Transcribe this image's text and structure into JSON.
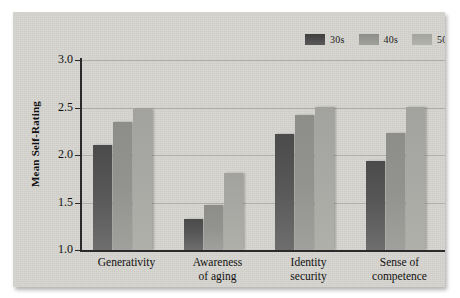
{
  "chart_data": {
    "type": "bar",
    "title": "",
    "xlabel": "",
    "ylabel": "Mean Self-Rating",
    "ylim": [
      1.0,
      3.0
    ],
    "ytick_labels": [
      "1.0",
      "1.5",
      "2.0",
      "2.5",
      "3.0"
    ],
    "ytick_values": [
      1.0,
      1.5,
      2.0,
      2.5,
      3.0
    ],
    "grid": true,
    "legend_position": "top-right",
    "categories": [
      {
        "lines": [
          "Generativity"
        ]
      },
      {
        "lines": [
          "Awareness",
          "of aging"
        ]
      },
      {
        "lines": [
          "Identity",
          "security"
        ]
      },
      {
        "lines": [
          "Sense of",
          "competence"
        ]
      }
    ],
    "series": [
      {
        "name": "30s",
        "color": "#4f4f4f",
        "values": [
          2.11,
          1.33,
          2.22,
          1.94
        ]
      },
      {
        "name": "40s",
        "color": "#919191",
        "values": [
          2.35,
          1.47,
          2.42,
          2.23
        ]
      },
      {
        "name": "50s",
        "color": "#a8a8a4",
        "values": [
          2.48,
          1.81,
          2.51,
          2.51
        ]
      }
    ]
  },
  "legend": {
    "items": [
      {
        "label": "30s"
      },
      {
        "label": "40s"
      },
      {
        "label": "50s"
      }
    ]
  },
  "axes": {
    "y_title": "Mean Self-Rating"
  },
  "colors": {
    "panel_background": "#d6d4cf",
    "page_background": "#ffffff",
    "gridline": "#b0aea9",
    "axis": "#2b2b2b",
    "text": "#111111"
  }
}
